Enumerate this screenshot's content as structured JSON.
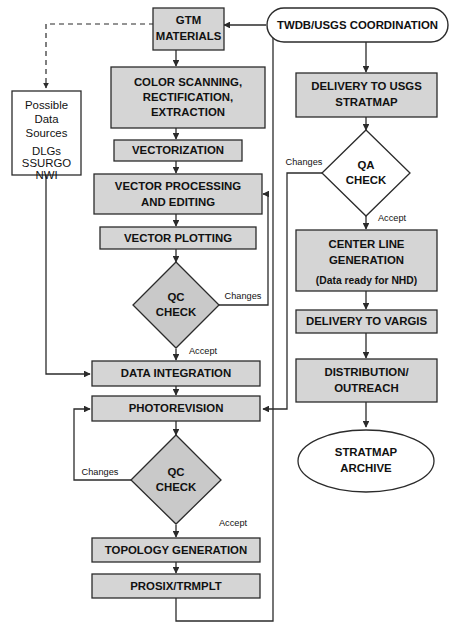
{
  "diagram": {
    "colors": {
      "box_fill": "#d5d5d5",
      "diamond_fill": "#c9c9c9",
      "white_fill": "#ffffff",
      "stroke": "#2b2b2b",
      "text": "#111111"
    }
  },
  "nodes": {
    "twdb_coordination": {
      "label": "TWDB/USGS COORDINATION",
      "shape": "stadium",
      "fill": "white"
    },
    "gtm_materials": {
      "line1": "GTM",
      "line2": "MATERIALS",
      "shape": "rect",
      "fill": "gray"
    },
    "color_scanning": {
      "line1": "COLOR SCANNING,",
      "line2": "RECTIFICATION,",
      "line3": "EXTRACTION",
      "shape": "rect",
      "fill": "gray"
    },
    "vectorization": {
      "label": "VECTORIZATION",
      "shape": "rect",
      "fill": "gray"
    },
    "vector_processing": {
      "line1": "VECTOR PROCESSING",
      "line2": "AND EDITING",
      "shape": "rect",
      "fill": "gray"
    },
    "vector_plotting": {
      "label": "VECTOR PLOTTING",
      "shape": "rect",
      "fill": "gray"
    },
    "qc_check_1": {
      "line1": "QC",
      "line2": "CHECK",
      "shape": "diamond",
      "fill": "gray"
    },
    "data_integration": {
      "label": "DATA INTEGRATION",
      "shape": "rect",
      "fill": "gray"
    },
    "photorevision": {
      "label": "PHOTOREVISION",
      "shape": "rect",
      "fill": "gray"
    },
    "qc_check_2": {
      "line1": "QC",
      "line2": "CHECK",
      "shape": "diamond",
      "fill": "gray"
    },
    "topology_generation": {
      "label": "TOPOLOGY GENERATION",
      "shape": "rect",
      "fill": "gray"
    },
    "prosix_trmplt": {
      "label": "PROSIX/TRMPLT",
      "shape": "rect",
      "fill": "gray"
    },
    "possible_data_sources": {
      "line1": "Possible",
      "line2": "Data",
      "line3": "Sources",
      "line4": "DLGs",
      "line5": "SSURGO",
      "line6": "NWI",
      "shape": "rect",
      "fill": "white"
    },
    "delivery_usgs": {
      "line1": "DELIVERY TO USGS",
      "line2": "STRATMAP",
      "shape": "rect",
      "fill": "gray"
    },
    "qa_check": {
      "line1": "QA",
      "line2": "CHECK",
      "shape": "diamond",
      "fill": "white"
    },
    "center_line_generation": {
      "line1": "CENTER LINE",
      "line2": "GENERATION",
      "line3": "(Data ready for NHD)",
      "shape": "rect",
      "fill": "gray"
    },
    "delivery_vargis": {
      "label": "DELIVERY TO VARGIS",
      "shape": "rect",
      "fill": "gray"
    },
    "distribution_outreach": {
      "line1": "DISTRIBUTION/",
      "line2": "OUTREACH",
      "shape": "rect",
      "fill": "gray"
    },
    "stratmap_archive": {
      "line1": "STRATMAP",
      "line2": "ARCHIVE",
      "shape": "ellipse",
      "fill": "white"
    }
  },
  "edge_labels": {
    "qc1_changes": "Changes",
    "qc1_accept": "Accept",
    "qc2_changes": "Changes",
    "qc2_accept": "Accept",
    "qa_changes": "Changes",
    "qa_accept": "Accept"
  }
}
